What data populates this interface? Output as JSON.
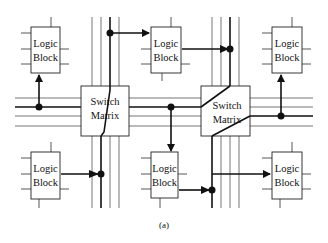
{
  "figure": {
    "caption": "(a)",
    "stroke_color": "#1a1a1a",
    "thin_line_color": "#555555",
    "background": "#ffffff"
  },
  "logic_blocks": [
    {
      "id": "lb-top-left",
      "line1": "Logic",
      "line2": "Block"
    },
    {
      "id": "lb-top-middle",
      "line1": "Logic",
      "line2": "Block"
    },
    {
      "id": "lb-top-right",
      "line1": "Logic",
      "line2": "Block"
    },
    {
      "id": "lb-bottom-left",
      "line1": "Logic",
      "line2": "Block"
    },
    {
      "id": "lb-bottom-middle",
      "line1": "Logic",
      "line2": "Block"
    },
    {
      "id": "lb-bottom-right",
      "line1": "Logic",
      "line2": "Block"
    }
  ],
  "switch_matrices": [
    {
      "id": "sm-left",
      "line1": "Switch",
      "line2": "Matrix"
    },
    {
      "id": "sm-right",
      "line1": "Switch",
      "line2": "Matrix"
    }
  ]
}
